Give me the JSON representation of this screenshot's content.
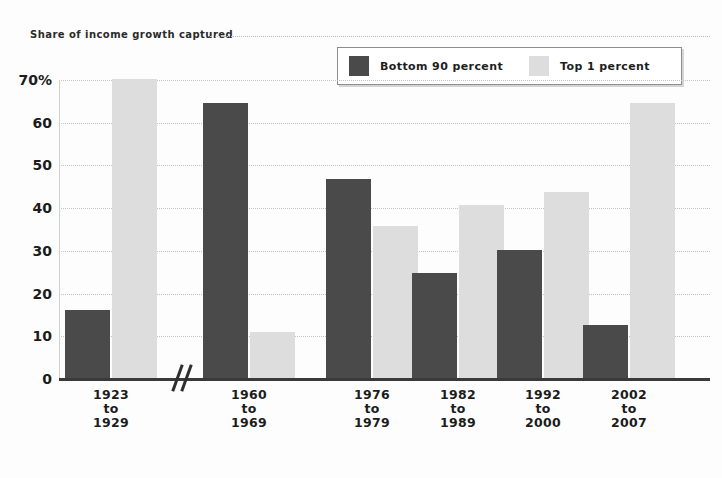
{
  "title": "Share of income growth captured",
  "legend": {
    "items": [
      {
        "label": "Bottom 90 percent",
        "color": "#4a4a4a",
        "key": "bottom90"
      },
      {
        "label": "Top 1 percent",
        "color": "#dddddd",
        "key": "top1"
      }
    ]
  },
  "axis": {
    "y_ticks": [
      "70%",
      "60",
      "50",
      "40",
      "30",
      "20",
      "10",
      "0"
    ],
    "y_tick_values": [
      70,
      60,
      50,
      40,
      30,
      20,
      10,
      0
    ],
    "y_unit": "%",
    "break_marker": "//"
  },
  "x_labels": [
    {
      "line1": "1923",
      "line2": "to",
      "line3": "1929"
    },
    {
      "line1": "1960",
      "line2": "to",
      "line3": "1969"
    },
    {
      "line1": "1976",
      "line2": "to",
      "line3": "1979"
    },
    {
      "line1": "1982",
      "line2": "to",
      "line3": "1989"
    },
    {
      "line1": "1992",
      "line2": "to",
      "line3": "2000"
    },
    {
      "line1": "2002",
      "line2": "to",
      "line3": "2007"
    }
  ],
  "colors": {
    "bottom90": "#4a4a4a",
    "top1": "#dddddd",
    "axis": "#3a3a3a",
    "grid": "#c2c2c2",
    "text": "#1c1c1c",
    "background": "#fdfdfd"
  },
  "chart_data": {
    "type": "bar",
    "title": "Share of income growth captured",
    "xlabel": "",
    "ylabel": "Share of income growth captured (percent)",
    "ylim": [
      0,
      70
    ],
    "grid": true,
    "legend_position": "top-right",
    "categories": [
      "1923 to 1929",
      "1960 to 1969",
      "1976 to 1979",
      "1982 to 1989",
      "1992 to 2000",
      "2002 to 2007"
    ],
    "series": [
      {
        "name": "Bottom 90 percent",
        "color": "#4a4a4a",
        "values": [
          16,
          64.5,
          46.5,
          24.5,
          30,
          12.5
        ]
      },
      {
        "name": "Top 1 percent",
        "color": "#dddddd",
        "values": [
          70,
          10.8,
          35.7,
          40.5,
          43.5,
          64.5
        ]
      }
    ],
    "axis_break_between": [
      "1923 to 1929",
      "1960 to 1969"
    ],
    "note": "x-axis has a break mark between the first and second category"
  }
}
